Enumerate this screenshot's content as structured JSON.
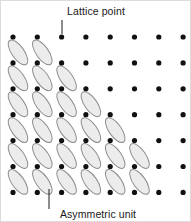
{
  "figure": {
    "width": 191,
    "height": 222,
    "background_color": "#ffffff"
  },
  "labels": {
    "lattice_point": "Lattice point",
    "asymmetric_unit": "Asymmetric unit"
  },
  "colors": {
    "dot": "#111111",
    "unit_fill": "#ececec",
    "unit_stroke": "#8d8d8d",
    "leader": "#1a1a1a",
    "text": "#1a1a1a"
  },
  "chart_data": {
    "type": "scatter",
    "xlabel": "",
    "ylabel": "",
    "grid": false,
    "legend": false,
    "lattice": {
      "columns": 8,
      "rows": 7,
      "origin_x": 12,
      "origin_y": 36,
      "spacing_x": 24.3,
      "spacing_y": 25.9,
      "dot_radius": 2.6,
      "total_points": 56
    },
    "asymmetric_unit": {
      "rx": 6.2,
      "ry": 14.5,
      "rotation_deg": -35,
      "offset_x": 5.0,
      "offset_y": -10.5,
      "units_per_row": [
        0,
        2,
        3,
        4,
        5,
        6,
        6
      ],
      "total_units": 26
    },
    "annotations": [
      {
        "text": "Lattice point",
        "text_x": 95,
        "text_y": 14,
        "anchor": "middle",
        "leader_x1": 61,
        "leader_y1": 19,
        "leader_x2": 61,
        "leader_y2": 33
      },
      {
        "text": "Asymmetric unit",
        "text_x": 97,
        "text_y": 217,
        "anchor": "middle",
        "leader_x1": 48,
        "leader_y1": 208,
        "leader_x2": 48,
        "leader_y2": 188
      }
    ]
  }
}
